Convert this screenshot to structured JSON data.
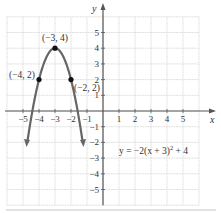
{
  "chart_data": {
    "type": "line",
    "title": "",
    "equation": "y = −2(x + 3)",
    "equation_exponent": "2",
    "equation_tail": " + 4",
    "function": "y = -2(x+3)^2 + 4",
    "xlabel": "x",
    "ylabel": "y",
    "xlim": [
      -6,
      6
    ],
    "ylim": [
      -6,
      6
    ],
    "grid": true,
    "x_ticks": [
      -5,
      -4,
      -3,
      -2,
      -1,
      1,
      2,
      3,
      4,
      5
    ],
    "y_ticks": [
      -5,
      -4,
      -3,
      -2,
      -1,
      1,
      2,
      3,
      4,
      5
    ],
    "x_tick_labels": [
      "−5",
      "−4",
      "−3",
      "−2",
      "−1",
      "1",
      "2",
      "3",
      "4",
      "5"
    ],
    "y_tick_labels": [
      "5",
      "4",
      "3",
      "2",
      "1",
      "−1",
      "−2",
      "−3",
      "−4",
      "−5"
    ],
    "points": [
      {
        "x": -3,
        "y": 4,
        "label": "(−3, 4)"
      },
      {
        "x": -4,
        "y": 2,
        "label": "(−4, 2)"
      },
      {
        "x": -2,
        "y": 2,
        "label": "(−2, 2)"
      }
    ],
    "series": [
      {
        "name": "y = -2(x+3)^2 + 4",
        "x": [
          -4.75,
          -4.5,
          -4,
          -3.5,
          -3,
          -2.5,
          -2,
          -1.5,
          -1.25
        ],
        "y": [
          -2.125,
          -0.5,
          2,
          3.5,
          4,
          3.5,
          2,
          -0.5,
          -2.125
        ]
      }
    ],
    "colors": {
      "curve": "#666666",
      "grid": "#d9d9d9",
      "axis": "#555555",
      "point": "#111111"
    }
  }
}
